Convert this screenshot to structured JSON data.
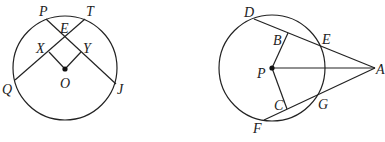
{
  "figures": [
    {
      "id": "left",
      "description": "Circle with center O, chords PJ and QT intersecting at E, perpendiculars OX and OY",
      "labels": {
        "P": "P",
        "T": "T",
        "E": "E",
        "X": "X",
        "Y": "Y",
        "O": "O",
        "Q": "Q",
        "J": "J"
      }
    },
    {
      "id": "right",
      "description": "Circle with center P, secants AD and AF, perpendiculars PB and PC, segment PA",
      "labels": {
        "D": "D",
        "B": "B",
        "E": "E",
        "P": "P",
        "A": "A",
        "C": "C",
        "G": "G",
        "F": "F"
      }
    }
  ],
  "colors": {
    "stroke": "#222222",
    "background": "#ffffff"
  }
}
